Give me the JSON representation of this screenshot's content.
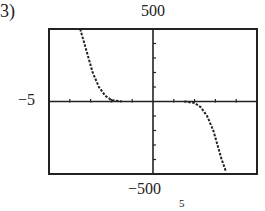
{
  "problem_label": "3)",
  "chart_data": {
    "type": "line",
    "title": "",
    "xlabel": "",
    "ylabel": "",
    "xlim": [
      -5,
      5
    ],
    "ylim": [
      -500,
      500
    ],
    "window_labels": {
      "ymax": "500",
      "ymin": "-500",
      "xmin": "-5",
      "xmax": "5"
    },
    "x_tick_step": 1,
    "y_tick_step": 100,
    "grid": false,
    "legend": null,
    "series": [
      {
        "name": "curve",
        "style": "dotted",
        "points": [
          [
            -3.5,
            500
          ],
          [
            -3.3,
            400
          ],
          [
            -3.1,
            300
          ],
          [
            -2.9,
            200
          ],
          [
            -2.6,
            100
          ],
          [
            -2.3,
            40
          ],
          [
            -2.0,
            10
          ],
          [
            -1.5,
            0
          ],
          [
            1.5,
            0
          ],
          [
            2.0,
            -10
          ],
          [
            2.3,
            -40
          ],
          [
            2.6,
            -100
          ],
          [
            2.9,
            -200
          ],
          [
            3.1,
            -300
          ],
          [
            3.3,
            -400
          ],
          [
            3.5,
            -480
          ]
        ]
      }
    ]
  }
}
